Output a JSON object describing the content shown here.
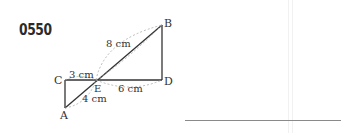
{
  "problem": {
    "number": "0550"
  },
  "figure": {
    "points": {
      "A": "A",
      "B": "B",
      "C": "C",
      "D": "D",
      "E": "E"
    },
    "labels": {
      "BE": "8 cm",
      "CE": "3 cm",
      "ED": "6 cm",
      "AE": "4 cm"
    }
  },
  "answer": {
    "value": ""
  }
}
